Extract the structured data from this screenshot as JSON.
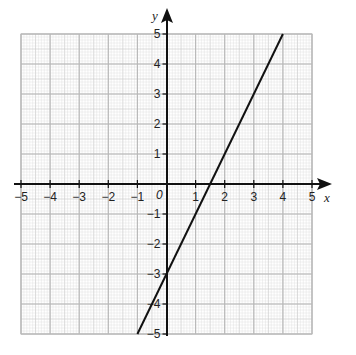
{
  "chart_data": {
    "type": "line",
    "title": "",
    "xlabel": "x",
    "ylabel": "y",
    "xlim": [
      -5,
      5
    ],
    "ylim": [
      -5,
      5
    ],
    "grid": true,
    "origin_label": "0",
    "x_ticks": [
      "−5",
      "−4",
      "−3",
      "−2",
      "−1",
      "1",
      "2",
      "3",
      "4",
      "5"
    ],
    "y_ticks": [
      "5",
      "4",
      "3",
      "2",
      "1",
      "−1",
      "−2",
      "−3",
      "−4",
      "−5"
    ],
    "series": [
      {
        "name": "y = 2x − 3",
        "x": [
          -1,
          4
        ],
        "y": [
          -5,
          5
        ],
        "color": "#111111"
      }
    ]
  },
  "colors": {
    "grid_major": "#b8b8b8",
    "grid_minor": "#dcdcdc",
    "axis": "#111111"
  }
}
